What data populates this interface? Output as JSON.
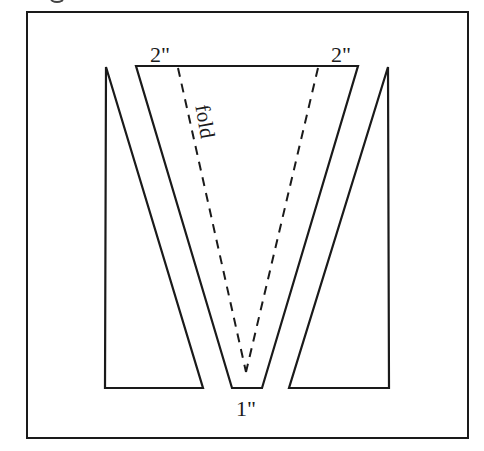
{
  "diagram": {
    "labels": {
      "top_left_width": "2\"",
      "top_right_width": "2\"",
      "bottom_width": "1\"",
      "fold": "fold"
    },
    "colors": {
      "stroke": "#1a1a1a",
      "background": "#ffffff"
    },
    "shapes": {
      "left_piece": [
        [
          106,
          67
        ],
        [
          203,
          388
        ],
        [
          105,
          388
        ]
      ],
      "center_trapezoid": [
        [
          136,
          66
        ],
        [
          358,
          66
        ],
        [
          262,
          388
        ],
        [
          232,
          388
        ]
      ],
      "right_piece": [
        [
          388,
          67
        ],
        [
          389,
          388
        ],
        [
          289,
          388
        ]
      ],
      "fold_lines": [
        [
          [
            178,
            66
          ],
          [
            246,
            372
          ]
        ],
        [
          [
            318,
            66
          ],
          [
            246,
            372
          ]
        ]
      ]
    }
  }
}
